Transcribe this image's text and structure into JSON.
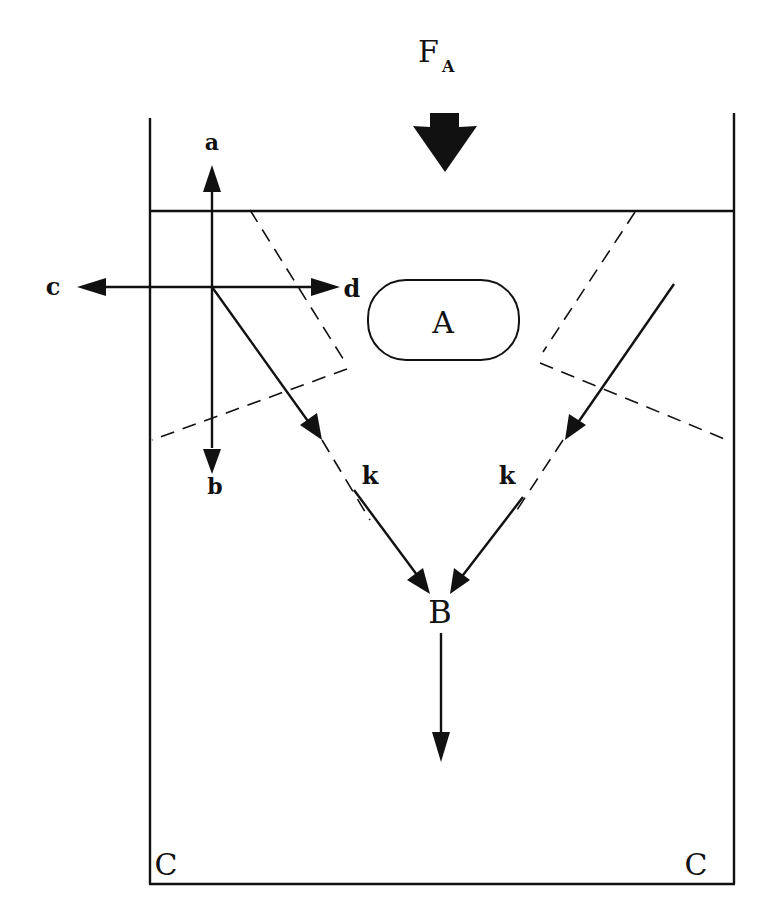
{
  "diagram": {
    "force_label": "F",
    "force_subscript": "A",
    "region_A_label": "A",
    "point_B_label": "B",
    "corner_left_label": "C",
    "corner_right_label": "C",
    "arrow_labels": {
      "up": "a",
      "down": "b",
      "left": "c",
      "right": "d"
    },
    "channel_left_label": "k",
    "channel_right_label": "k",
    "colors": {
      "stroke": "#111111",
      "background": "#ffffff"
    }
  }
}
